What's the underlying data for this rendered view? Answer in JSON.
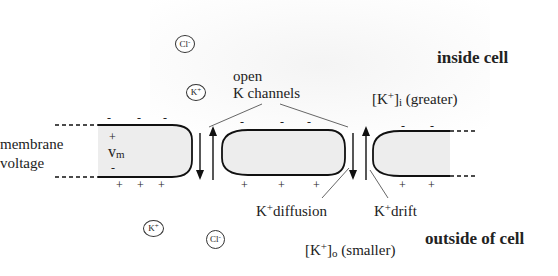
{
  "diagram": {
    "regions": {
      "inside": "inside cell",
      "outside": "outside of cell"
    },
    "labels": {
      "open": "open",
      "k_channels": "K channels",
      "membrane": "membrane",
      "voltage": "voltage",
      "vm_main": "v",
      "vm_sub": "m",
      "ki_bracket_open": "[K",
      "ki_sup": "+",
      "ki_bracket_close": "]",
      "ki_sub": "i",
      "ki_note": "(greater)",
      "ko_bracket_open": "[K",
      "ko_sup": "+",
      "ko_bracket_close": "]",
      "ko_sub": "o",
      "ko_note": "(smaller)",
      "diffusion_k": "K",
      "diffusion_sup": "+",
      "diffusion_text": "diffusion",
      "drift_k": "K",
      "drift_sup": "+",
      "drift_text": "drift"
    },
    "ions": [
      {
        "symbol": "Cl",
        "charge": "-",
        "side": "inside"
      },
      {
        "symbol": "K",
        "charge": "+",
        "side": "inside"
      },
      {
        "symbol": "K",
        "charge": "+",
        "side": "outside"
      },
      {
        "symbol": "Cl",
        "charge": "-",
        "side": "outside"
      }
    ],
    "charges": {
      "inside_sign": "-",
      "outside_sign": "+",
      "vm_top": "+",
      "vm_bottom": "-"
    },
    "colors": {
      "membrane_fill": "#ededed",
      "stroke": "#111111",
      "leader": "#555555"
    }
  }
}
